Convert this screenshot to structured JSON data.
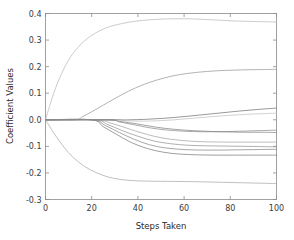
{
  "figure": {
    "background": "#ffffff",
    "axis_color": "#8a8a8a",
    "text_color": "#333333"
  },
  "chart_data": {
    "type": "line",
    "title": "",
    "subtitle": "",
    "xlabel": "Steps Taken",
    "ylabel": "Coefficient Values",
    "xlim": [
      0,
      100
    ],
    "ylim": [
      -0.3,
      0.4
    ],
    "xticks": [
      0,
      20,
      40,
      60,
      80,
      100
    ],
    "xtick_labels": [
      "0",
      "20",
      "40",
      "60",
      "80",
      "100"
    ],
    "yticks": [
      -0.3,
      -0.2,
      -0.1,
      0.0,
      0.1,
      0.2,
      0.3,
      0.4
    ],
    "ytick_labels": [
      "-0.3",
      "-0.2",
      "-0.1",
      "0.0",
      "0.1",
      "0.2",
      "0.3",
      "0.4"
    ],
    "grid": false,
    "legend": null,
    "legend_position": "none",
    "tick_direction": "in",
    "box": true,
    "annotations": [],
    "series": [
      {
        "name": "coef-1",
        "color": "#b9b9b9",
        "x": [
          0,
          3,
          6,
          10,
          14,
          18,
          22,
          26,
          30,
          36,
          42,
          48,
          55,
          62,
          68,
          75,
          82,
          90,
          100
        ],
        "values": [
          0.0,
          0.085,
          0.155,
          0.225,
          0.272,
          0.305,
          0.328,
          0.345,
          0.356,
          0.367,
          0.374,
          0.378,
          0.38,
          0.38,
          0.378,
          0.375,
          0.372,
          0.37,
          0.368
        ]
      },
      {
        "name": "coef-2",
        "color": "#9a9a9a",
        "x": [
          0,
          13,
          16,
          20,
          25,
          30,
          36,
          42,
          48,
          55,
          62,
          70,
          78,
          86,
          94,
          100
        ],
        "values": [
          0.0,
          0.0,
          0.012,
          0.03,
          0.055,
          0.08,
          0.108,
          0.131,
          0.149,
          0.165,
          0.175,
          0.182,
          0.186,
          0.188,
          0.189,
          0.19
        ]
      },
      {
        "name": "coef-3",
        "color": "#c2c2c2",
        "x": [
          0,
          28,
          34,
          40,
          48,
          56,
          64,
          72,
          80,
          88,
          94,
          100
        ],
        "values": [
          0.0,
          0.0,
          -0.003,
          -0.005,
          -0.004,
          0.0,
          0.006,
          0.012,
          0.017,
          0.021,
          0.023,
          0.025
        ]
      },
      {
        "name": "coef-4",
        "color": "#777777",
        "x": [
          0,
          29,
          36,
          44,
          52,
          60,
          68,
          76,
          84,
          92,
          100
        ],
        "values": [
          0.0,
          0.0,
          0.0,
          0.002,
          0.006,
          0.012,
          0.019,
          0.026,
          0.033,
          0.039,
          0.044
        ]
      },
      {
        "name": "coef-5",
        "color": "#8e8e8e",
        "x": [
          0,
          27,
          32,
          38,
          45,
          52,
          60,
          68,
          76,
          84,
          92,
          100
        ],
        "values": [
          0.0,
          0.0,
          -0.008,
          -0.018,
          -0.03,
          -0.038,
          -0.043,
          -0.045,
          -0.045,
          -0.043,
          -0.041,
          -0.039
        ]
      },
      {
        "name": "coef-6",
        "color": "#a5a5a5",
        "x": [
          0,
          22,
          28,
          34,
          40,
          47,
          54,
          62,
          70,
          78,
          86,
          94,
          100
        ],
        "values": [
          0.0,
          0.0,
          -0.012,
          -0.028,
          -0.045,
          -0.062,
          -0.073,
          -0.08,
          -0.083,
          -0.084,
          -0.084,
          -0.084,
          -0.084
        ]
      },
      {
        "name": "coef-7",
        "color": "#959595",
        "x": [
          0,
          21,
          27,
          33,
          40,
          47,
          54,
          62,
          70,
          78,
          86,
          94,
          100
        ],
        "values": [
          0.0,
          0.0,
          -0.018,
          -0.04,
          -0.062,
          -0.08,
          -0.09,
          -0.096,
          -0.098,
          -0.099,
          -0.1,
          -0.101,
          -0.102
        ]
      },
      {
        "name": "coef-8",
        "color": "#8a8a8a",
        "x": [
          0,
          20,
          26,
          32,
          38,
          45,
          52,
          60,
          68,
          76,
          84,
          92,
          100
        ],
        "values": [
          0.0,
          0.0,
          -0.022,
          -0.048,
          -0.072,
          -0.094,
          -0.106,
          -0.112,
          -0.114,
          -0.114,
          -0.113,
          -0.112,
          -0.111
        ]
      },
      {
        "name": "coef-9",
        "color": "#7f7f7f",
        "x": [
          0,
          20,
          25,
          31,
          37,
          44,
          51,
          58,
          66,
          74,
          82,
          90,
          100
        ],
        "values": [
          0.0,
          0.0,
          -0.026,
          -0.056,
          -0.085,
          -0.108,
          -0.122,
          -0.129,
          -0.132,
          -0.133,
          -0.133,
          -0.133,
          -0.133
        ]
      },
      {
        "name": "coef-10",
        "color": "#868686",
        "x": [
          0,
          26,
          32,
          40,
          48,
          56,
          64,
          72,
          80,
          88,
          94,
          100
        ],
        "values": [
          0.0,
          0.0,
          -0.006,
          -0.016,
          -0.028,
          -0.036,
          -0.041,
          -0.044,
          -0.046,
          -0.047,
          -0.047,
          -0.048
        ]
      },
      {
        "name": "coef-11",
        "color": "#ababab",
        "x": [
          0,
          4,
          8,
          12,
          17,
          22,
          27,
          32,
          38,
          45,
          55,
          65,
          75,
          85,
          95,
          100
        ],
        "values": [
          0.0,
          -0.055,
          -0.103,
          -0.142,
          -0.176,
          -0.199,
          -0.215,
          -0.224,
          -0.229,
          -0.231,
          -0.232,
          -0.233,
          -0.235,
          -0.237,
          -0.239,
          -0.24
        ]
      }
    ]
  },
  "axes": {
    "x_title": "Steps Taken",
    "y_title": "Coefficient Values"
  }
}
